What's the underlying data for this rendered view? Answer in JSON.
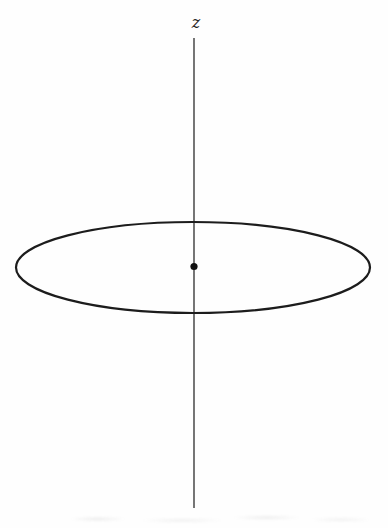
{
  "figure": {
    "axis_label": "z",
    "colors": {
      "background": "#fefefe",
      "axis_line": "#3b3b3b",
      "ellipse_stroke": "#1c1c1c",
      "dot_fill": "#111111",
      "label": "#222222"
    }
  }
}
